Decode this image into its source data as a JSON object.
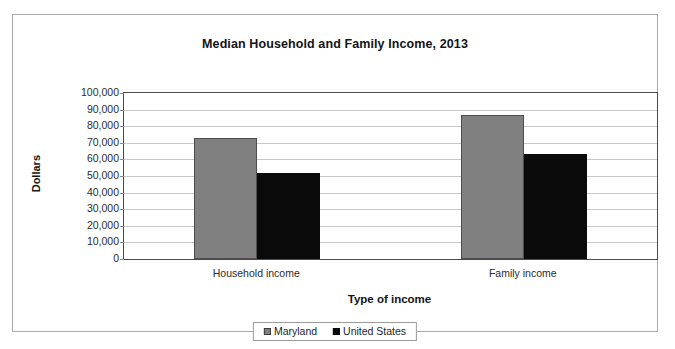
{
  "chart_data": {
    "type": "bar",
    "title": "Median Household and Family Income, 2013",
    "xlabel": "Type of income",
    "ylabel": "Dollars",
    "categories": [
      "Household income",
      "Family income"
    ],
    "series": [
      {
        "name": "Maryland",
        "color": "#808080",
        "values": [
          73000,
          86500
        ]
      },
      {
        "name": "United States",
        "color": "#0a0a0a",
        "values": [
          52000,
          63000
        ]
      }
    ],
    "ylim": [
      0,
      100000
    ],
    "ytick_values": [
      0,
      10000,
      20000,
      30000,
      40000,
      50000,
      60000,
      70000,
      80000,
      90000,
      100000
    ],
    "ytick_labels": [
      "0",
      "10,000",
      "20,000",
      "30,000",
      "40,000",
      "50,000",
      "60,000",
      "70,000",
      "80,000",
      "90,000",
      "100,000"
    ],
    "grid": true,
    "legend_position": "bottom"
  },
  "legend": {
    "entries": [
      {
        "label": "Maryland",
        "swatch": "gray-square-icon"
      },
      {
        "label": "United States",
        "swatch": "black-square-icon"
      }
    ]
  }
}
